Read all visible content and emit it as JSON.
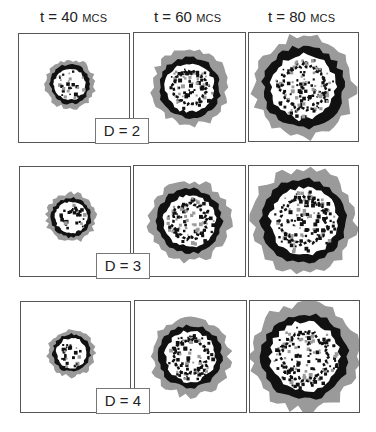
{
  "columns": [
    {
      "t_label": "t = 40",
      "unit": "MCS"
    },
    {
      "t_label": "t = 60",
      "unit": "MCS"
    },
    {
      "t_label": "t = 80",
      "unit": "MCS"
    }
  ],
  "rows": [
    {
      "d_label": "D = 2",
      "radii": [
        22,
        34,
        45
      ]
    },
    {
      "d_label": "D = 3",
      "radii": [
        22,
        36,
        47
      ]
    },
    {
      "d_label": "D = 4",
      "radii": [
        21,
        35,
        48
      ]
    }
  ],
  "colors": {
    "outer_ring": "#9a9a9a",
    "front_ring": "#111111",
    "interior": "#ffffff",
    "border": "#555555"
  }
}
